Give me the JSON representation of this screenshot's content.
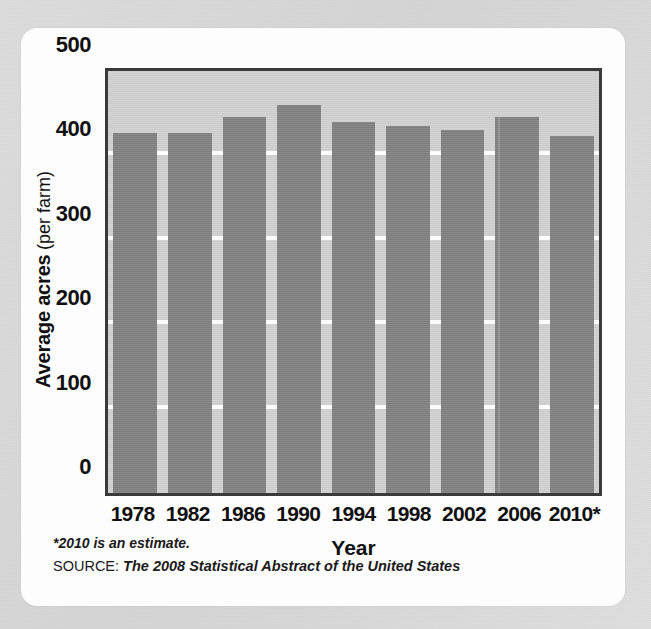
{
  "figure": {
    "ylabel_bold": "Average acres",
    "ylabel_light": "(per farm)",
    "xlabel": "Year",
    "footnote": "*2010 is an estimate.",
    "source_label": "SOURCE:",
    "source_title": "The 2008 Statistical Abstract of the United States",
    "colors": {
      "bar": "#7e7e7e",
      "plot_background": "#cfcfcf",
      "gridline": "#ffffff",
      "frame": "#3a3a3a",
      "card": "#fdfdfd",
      "page": "#d9d9d9",
      "text": "#111111"
    }
  },
  "chart_data": {
    "type": "bar",
    "title": "",
    "xlabel": "Year",
    "ylabel": "Average acres (per farm)",
    "categories": [
      "1978",
      "1982",
      "1986",
      "1990",
      "1994",
      "1998",
      "2002",
      "2006",
      "2010*"
    ],
    "values": [
      427,
      426,
      446,
      460,
      440,
      435,
      430,
      446,
      423
    ],
    "ylim": [
      0,
      500
    ],
    "yticks": [
      0,
      100,
      200,
      300,
      400,
      500
    ],
    "ytick_labels": [
      "0",
      "100",
      "200",
      "300",
      "400",
      "500"
    ],
    "grid": true,
    "grid_axis": "y",
    "legend": false,
    "annotations": [
      "*2010 is an estimate.",
      "SOURCE: The 2008 Statistical Abstract of the United States"
    ]
  }
}
